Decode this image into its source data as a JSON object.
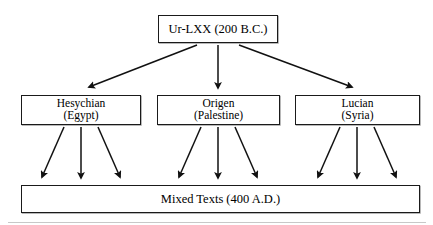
{
  "diagram": {
    "type": "flowchart",
    "orientation": "top-down",
    "background_color": "#ffffff",
    "line_color": "#1a1a1a",
    "text_color": "#000000",
    "nodes": {
      "root": {
        "id": "ur-lxx",
        "lines": [
          "Ur-LXX (200 B.C.)"
        ],
        "label": "Ur-LXX (200 B.C.)"
      },
      "hesychian": {
        "id": "hesychian",
        "lines": [
          "Hesychian",
          "(Egypt)"
        ],
        "label": "Hesychian (Egypt)"
      },
      "origen": {
        "id": "origen",
        "lines": [
          "Origen",
          "(Palestine)"
        ],
        "label": "Origen (Palestine)"
      },
      "lucian": {
        "id": "lucian",
        "lines": [
          "Lucian",
          "(Syria)"
        ],
        "label": "Lucian (Syria)"
      },
      "mixed": {
        "id": "mixed-texts",
        "lines": [
          "Mixed Texts (400 A.D.)"
        ],
        "label": "Mixed Texts (400 A.D.)"
      }
    },
    "edges": [
      {
        "from": "ur-lxx",
        "to": "hesychian",
        "style": "solid-arrow"
      },
      {
        "from": "ur-lxx",
        "to": "origen",
        "style": "solid-arrow"
      },
      {
        "from": "ur-lxx",
        "to": "lucian",
        "style": "solid-arrow"
      },
      {
        "from": "hesychian",
        "to": "mixed-texts",
        "style": "solid-arrow"
      },
      {
        "from": "hesychian",
        "to": "mixed-texts",
        "style": "solid-arrow"
      },
      {
        "from": "hesychian",
        "to": "mixed-texts",
        "style": "solid-arrow"
      },
      {
        "from": "origen",
        "to": "mixed-texts",
        "style": "solid-arrow"
      },
      {
        "from": "origen",
        "to": "mixed-texts",
        "style": "solid-arrow"
      },
      {
        "from": "origen",
        "to": "mixed-texts",
        "style": "solid-arrow"
      },
      {
        "from": "lucian",
        "to": "mixed-texts",
        "style": "solid-arrow"
      },
      {
        "from": "lucian",
        "to": "mixed-texts",
        "style": "solid-arrow"
      },
      {
        "from": "lucian",
        "to": "mixed-texts",
        "style": "solid-arrow"
      }
    ]
  }
}
